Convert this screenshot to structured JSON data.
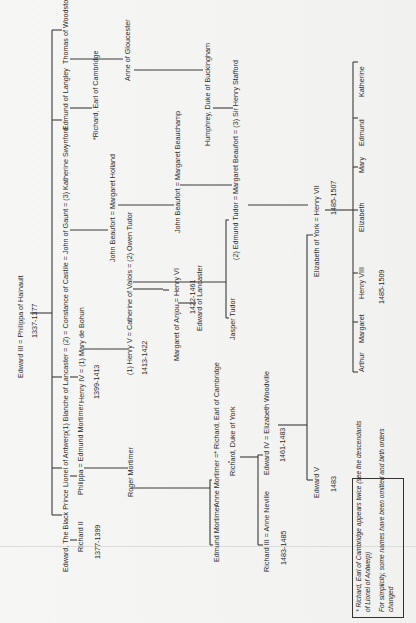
{
  "document": {
    "type": "family-tree",
    "orientation": "rotated-90-ccw",
    "generation_1": {
      "couple": "Edward III = Philippa of Hainault",
      "reign": "1337-1377"
    },
    "generation_2": {
      "black_prince": "Edward, The Black Prince",
      "lionel": "Lionel of Antwerp",
      "gaunt": "(1) Blanche of Lancaster = (2) = Constance of Castile = John of Gaunt = (3) Katherine Swynford",
      "langley": "Edmund of Langley",
      "woodstock": "Thomas of Woodstock"
    },
    "generation_3": {
      "richard_ii": "Richard II",
      "richard_ii_reign": "1377-1399",
      "philippa": "Philippa = Edmund Mortimer",
      "henry_iv": "Henry IV = (1) Mary de Bohun",
      "henry_iv_reign": "1399-1413",
      "john_beaufort_1": "John Beaufort = Margaret Holland",
      "richard_cambridge_1": "*Richard, Earl of Cambridge",
      "anne_gloucester": "Anne of Gloucester"
    },
    "generation_4": {
      "roger_mortimer": "Roger Mortimer",
      "henry_v": "(1) Henry V = Catherine of Valois = (2) Owen Tudor",
      "henry_v_reign": "1413-1422",
      "john_beaufort_2": "John Beaufort = Margaret Beauchamp",
      "humphrey": "Humphrey, Duke of Buckingham"
    },
    "generation_5": {
      "edmund_mortimer": "Edmund Mortimer",
      "anne_mortimer": "Anne Mortimer =* Richard, Earl of Cambridge",
      "margaret_anjou": "Margaret of Anjou = Henry VI",
      "henry_vi_reign": "1422-1461",
      "jasper_tudor": "Jasper Tudor",
      "edmund_tudor": "(2) Edmund Tudor = Margaret Beaufort = (3) Sir Henry Stafford"
    },
    "generation_6": {
      "richard_york": "Richard, Duke of York",
      "edward_lancaster": "Edward of Lancaster"
    },
    "generation_7": {
      "richard_iii": "Richard III = Anne Neville",
      "richard_iii_reign": "1483-1485",
      "edward_iv": "Edward IV = Elizabeth Woodville",
      "edward_iv_reign": "1461-1483"
    },
    "generation_8": {
      "edward_v": "Edward V",
      "edward_v_reign": "1483",
      "elizabeth_york": "Elizabeth of York = Henry VII",
      "henry_vii_reign": "1485-1507"
    },
    "generation_9": {
      "arthur": "Arthur",
      "margaret": "Margaret",
      "henry_viii": "Henry VIII",
      "henry_viii_reign": "1485-1509",
      "elizabeth": "Elizabeth",
      "mary": "Mary",
      "edmund": "Edmund",
      "katherine": "Katherine"
    },
    "notes": {
      "line1": "* Richard, Earl of Cambridge appears twice (see the descendants",
      "line2": "of Lionel of Antwerp)",
      "line3": "For simplicity, some names have been omitted and birth orders",
      "line4": "changed"
    },
    "colors": {
      "paper": "#f4f4f2",
      "ink": "#2a2a2a",
      "lines": "#3a3a3a"
    }
  }
}
